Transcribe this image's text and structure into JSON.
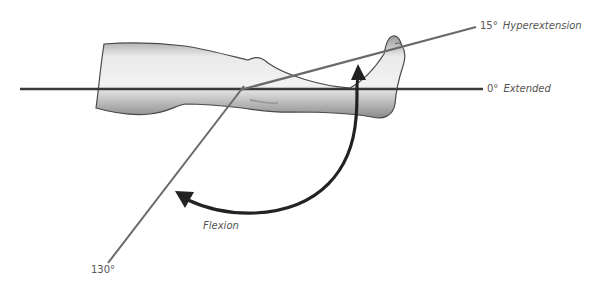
{
  "diagram": {
    "labels": {
      "hyperextension_deg": "15°",
      "hyperextension_name": "Hyperextension",
      "extended_deg": "0°",
      "extended_name": "Extended",
      "flexion_deg": "130°",
      "flexion_name": "Flexion"
    },
    "colors": {
      "line": "#555555",
      "baseline": "#3a3a3a",
      "arrow": "#222222",
      "text": "#555555"
    }
  }
}
